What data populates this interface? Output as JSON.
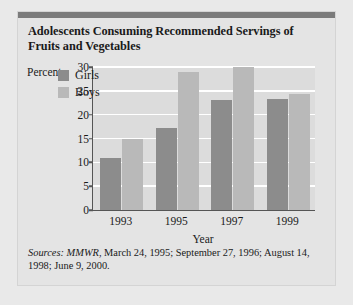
{
  "title": "Adolescents Consuming Recommended Servings of Fruits and Vegetables",
  "sources": {
    "label": "Sources:",
    "publication": "MMWR",
    "rest": ", March 24, 1995; September 27, 1996; August 14, 1998; June 9, 2000."
  },
  "chart_data": {
    "type": "bar",
    "title": "Adolescents Consuming Recommended Servings of Fruits and Vegetables",
    "xlabel": "Year",
    "ylabel": "Percent",
    "categories": [
      "1993",
      "1995",
      "1997",
      "1999"
    ],
    "series": [
      {
        "name": "Girls",
        "color": "#8c8c8c",
        "values": [
          11,
          17.3,
          23,
          23.3
        ]
      },
      {
        "name": "Boys",
        "color": "#b9b9b9",
        "values": [
          15,
          29,
          30,
          24.4
        ]
      }
    ],
    "ylim": [
      0,
      30
    ],
    "yticks": [
      0,
      5,
      10,
      15,
      20,
      25,
      30
    ],
    "grid": true,
    "legend_position": "top-left-inside"
  }
}
